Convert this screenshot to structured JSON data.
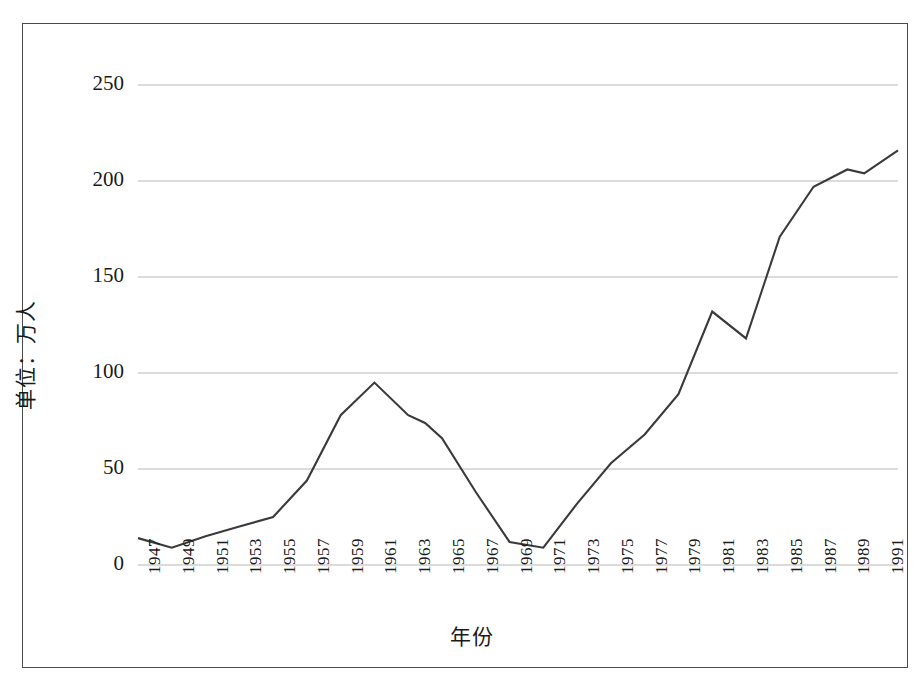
{
  "chart_data": {
    "type": "line",
    "title": "",
    "subtitle": "",
    "xlabel": "年份",
    "ylabel": "单位：万人",
    "xlim": [
      1947,
      1992
    ],
    "ylim": [
      0,
      250
    ],
    "yticks": [
      0,
      50,
      100,
      150,
      200,
      250
    ],
    "ytick_labels": [
      "0",
      "50",
      "100",
      "150",
      "200",
      "250"
    ],
    "xticks": [
      1947,
      1949,
      1951,
      1953,
      1955,
      1957,
      1959,
      1961,
      1963,
      1965,
      1967,
      1969,
      1971,
      1973,
      1975,
      1977,
      1979,
      1981,
      1983,
      1985,
      1987,
      1989,
      1991
    ],
    "xtick_labels": [
      "1947",
      "1949",
      "1951",
      "1953",
      "1955",
      "1957",
      "1959",
      "1961",
      "1963",
      "1965",
      "1967",
      "1969",
      "1971",
      "1973",
      "1975",
      "1977",
      "1979",
      "1981",
      "1983",
      "1985",
      "1987",
      "1989",
      "1991"
    ],
    "grid": "horizontal",
    "legend": "none",
    "line_color": "#3a3a3a",
    "grid_color": "#b8b8b8",
    "series": [
      {
        "name": "人数",
        "x": [
          1947,
          1949,
          1951,
          1953,
          1955,
          1957,
          1959,
          1961,
          1963,
          1964,
          1965,
          1967,
          1969,
          1971,
          1973,
          1975,
          1977,
          1979,
          1981,
          1983,
          1985,
          1987,
          1989,
          1990,
          1992
        ],
        "values": [
          14,
          9,
          15,
          20,
          25,
          44,
          78,
          95,
          78,
          74,
          66,
          38,
          12,
          9,
          32,
          53,
          68,
          89,
          132,
          118,
          171,
          197,
          206,
          204,
          216
        ]
      }
    ]
  },
  "axis_titles": {
    "y": "单位：万人",
    "x": "年份"
  }
}
